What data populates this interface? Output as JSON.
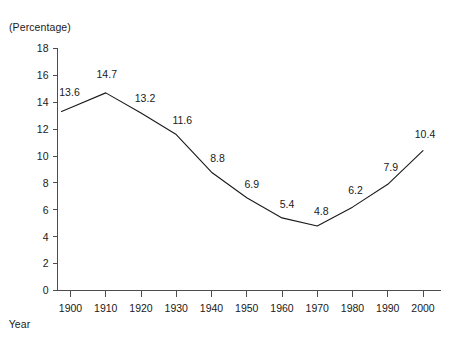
{
  "chart_data": {
    "type": "line",
    "title": "",
    "subtitle": "",
    "ylabel": "(Percentage)",
    "xlabel": "Year",
    "categories": [
      1900,
      1910,
      1920,
      1930,
      1940,
      1950,
      1960,
      1970,
      1980,
      1990,
      2000
    ],
    "values": [
      13.6,
      14.7,
      13.2,
      11.6,
      8.8,
      6.9,
      5.4,
      4.8,
      6.2,
      7.9,
      10.4
    ],
    "point_labels": [
      "13.6",
      "14.7",
      "13.2",
      "11.6",
      "8.8",
      "6.9",
      "5.4",
      "4.8",
      "6.2",
      "7.9",
      "10.4"
    ],
    "xtick_labels": [
      "1900",
      "1910",
      "1920",
      "1930",
      "1940",
      "1950",
      "1960",
      "1970",
      "1980",
      "1990",
      "2000"
    ],
    "ytick_labels": [
      "0",
      "2",
      "4",
      "6",
      "8",
      "10",
      "12",
      "14",
      "16",
      "18"
    ],
    "yticks": [
      0,
      2,
      4,
      6,
      8,
      10,
      12,
      14,
      16,
      18
    ],
    "ylim": [
      0,
      18
    ],
    "xlim": [
      1900,
      2000
    ],
    "grid": false,
    "legend": false,
    "legend_position": "none",
    "line_color": "#1a1a1a",
    "axis_color": "#4d4d4d",
    "background_color": "#ffffff",
    "markers": false
  }
}
